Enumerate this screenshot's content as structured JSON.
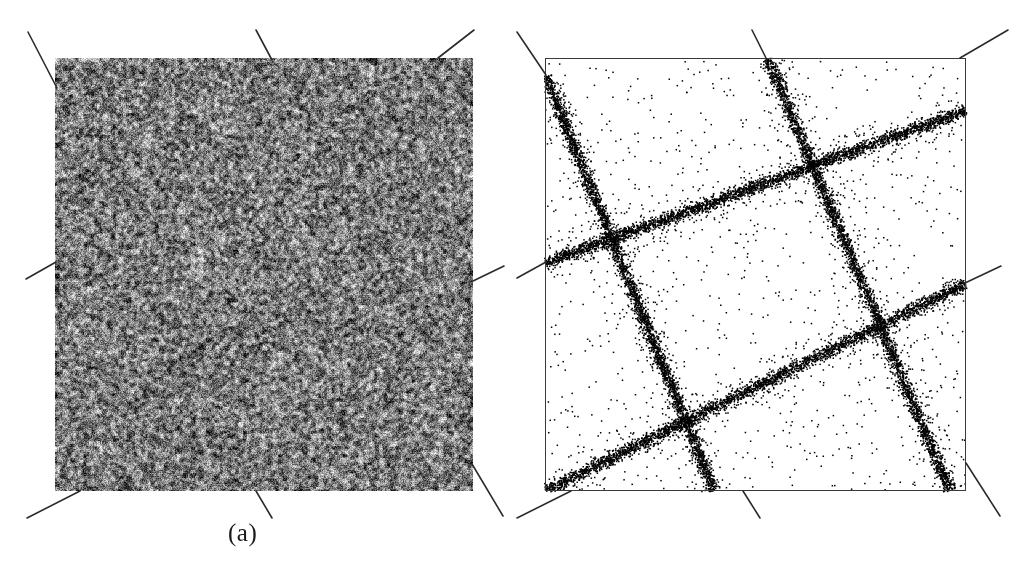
{
  "figure": {
    "title": "",
    "width": 1020,
    "height": 575,
    "background": "#ffffff",
    "ink_color": "#111111",
    "pointer_color": "#2b2b2b"
  },
  "panels": [
    {
      "id": "a",
      "caption": "(a)",
      "caption_x": 228,
      "caption_y": 519,
      "kind": "noise-image",
      "description": "uniform salt-and-pepper grayscale noise square",
      "box": {
        "x": 55,
        "y": 58,
        "w": 418,
        "h": 433
      },
      "border": false,
      "fill_mean_gray": "#8a8a8a",
      "noise_black": "#1c1c1c",
      "noise_white": "#d8d8d8",
      "noise_density": 0.5,
      "noise_cell": 1.6
    },
    {
      "id": "b",
      "caption": "(b)",
      "caption_x": 728,
      "caption_y": 519,
      "kind": "point-scatter",
      "description": "sparse black dot scatter concentrated along four straight lines",
      "box": {
        "x": 35,
        "y": 58,
        "w": 420,
        "h": 432
      },
      "border": true,
      "border_color": "#3a3a3a",
      "border_width": 1,
      "dot_color": "#000000",
      "background_points": 900,
      "line_points_each": 3400,
      "line_sigma": 3.2,
      "dot_size": 1.5
    }
  ],
  "chart_data": {
    "type": "scatter",
    "title": "",
    "xlabel": "",
    "ylabel": "",
    "panel_a": {
      "label": "(a)",
      "content": "noise image",
      "xlim": [
        0,
        418
      ],
      "ylim": [
        0,
        433
      ]
    },
    "panel_b": {
      "label": "(b)",
      "content": "recovered lines from noise",
      "xlim": [
        0,
        420
      ],
      "ylim": [
        0,
        432
      ],
      "lines": [
        {
          "name": "line-1",
          "x1": 0,
          "y1": 17,
          "x2": 168,
          "y2": 432
        },
        {
          "name": "line-2",
          "x1": 222,
          "y1": 0,
          "x2": 404,
          "y2": 432
        },
        {
          "name": "line-3",
          "x1": 0,
          "y1": 204,
          "x2": 420,
          "y2": 52
        },
        {
          "name": "line-4",
          "x1": 0,
          "y1": 432,
          "x2": 420,
          "y2": 225
        }
      ]
    }
  },
  "pointers": {
    "description": "thin straight segments that extend each detected line beyond the image boundary",
    "panel_a": [
      {
        "name": "pointer-top-left",
        "x1": 28,
        "y1": 32,
        "x2": 57,
        "y2": 88
      },
      {
        "name": "pointer-top-mid",
        "x1": 256,
        "y1": 30,
        "x2": 272,
        "y2": 60
      },
      {
        "name": "pointer-top-right",
        "x1": 474,
        "y1": 30,
        "x2": 438,
        "y2": 58
      },
      {
        "name": "pointer-left",
        "x1": 26,
        "y1": 279,
        "x2": 56,
        "y2": 262
      },
      {
        "name": "pointer-right",
        "x1": 504,
        "y1": 266,
        "x2": 473,
        "y2": 281
      },
      {
        "name": "pointer-bottom-left",
        "x1": 27,
        "y1": 518,
        "x2": 80,
        "y2": 491
      },
      {
        "name": "pointer-bottom-mid",
        "x1": 272,
        "y1": 518,
        "x2": 256,
        "y2": 491
      },
      {
        "name": "pointer-bottom-right",
        "x1": 503,
        "y1": 516,
        "x2": 472,
        "y2": 464
      }
    ],
    "panel_b": [
      {
        "name": "pointer-top-left",
        "x1": 7,
        "y1": 32,
        "x2": 36,
        "y2": 75
      },
      {
        "name": "pointer-top-mid",
        "x1": 242,
        "y1": 30,
        "x2": 256,
        "y2": 58
      },
      {
        "name": "pointer-top-right",
        "x1": 498,
        "y1": 30,
        "x2": 450,
        "y2": 58
      },
      {
        "name": "pointer-left",
        "x1": 7,
        "y1": 278,
        "x2": 36,
        "y2": 262
      },
      {
        "name": "pointer-right",
        "x1": 491,
        "y1": 266,
        "x2": 455,
        "y2": 283
      },
      {
        "name": "pointer-bottom-left",
        "x1": 7,
        "y1": 518,
        "x2": 61,
        "y2": 491
      },
      {
        "name": "pointer-bottom-mid",
        "x1": 250,
        "y1": 518,
        "x2": 233,
        "y2": 491
      },
      {
        "name": "pointer-bottom-right",
        "x1": 490,
        "y1": 516,
        "x2": 456,
        "y2": 463
      }
    ]
  }
}
